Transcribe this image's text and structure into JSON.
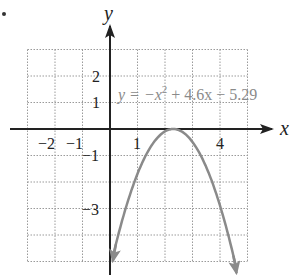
{
  "chart_data": {
    "type": "line",
    "title": "",
    "xlabel": "x",
    "ylabel": "y",
    "xlim": [
      -3,
      5
    ],
    "ylim": [
      -5,
      3
    ],
    "grid": true,
    "grid_style": "dotted",
    "x_tick_labels": [
      "-2",
      "-1",
      "1",
      "4"
    ],
    "x_tick_values": [
      -2,
      -1,
      1,
      4
    ],
    "y_tick_labels": [
      "2",
      "1",
      "-1",
      "-3"
    ],
    "y_tick_values": [
      2,
      1,
      -1,
      -3
    ],
    "series": [
      {
        "name": "y = -x^2 + 4.6x - 5.29",
        "equation": {
          "a": -1,
          "b": 4.6,
          "c": -5.29
        },
        "vertex": [
          2.3,
          0
        ],
        "x_range": [
          0.1,
          4.6
        ],
        "color": "#8a8a8a",
        "arrows_at_ends": true
      }
    ],
    "annotations": [
      {
        "text_parts": [
          "y = −x",
          "2",
          " + 4.6x − 5.29"
        ],
        "position": "upper right of y-axis",
        "color": "#8a8a8a"
      }
    ]
  },
  "labels": {
    "x_axis": "x",
    "y_axis": "y",
    "eq_main": "y = −x",
    "eq_sup": "2",
    "eq_rest": " + 4.6x − 5.29",
    "ticks": {
      "xm2": "−2",
      "xm1": "−1",
      "x1": "1",
      "x4": "4",
      "y2": "2",
      "y1": "1",
      "ym1": "−1",
      "ym3": "−3"
    }
  },
  "colors": {
    "axis": "#222222",
    "grid": "#9a9a9a",
    "curve": "#8a8a8a"
  }
}
